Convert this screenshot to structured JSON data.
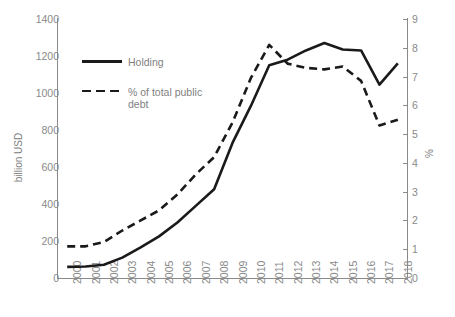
{
  "chart_data": {
    "type": "line",
    "title": "",
    "xlabel": "",
    "ylabel": "billion USD",
    "y2label": "%",
    "grid": false,
    "legend_position": "inside-upper-left",
    "categories": [
      "2000",
      "2001",
      "2002",
      "2003",
      "2004",
      "2005",
      "2006",
      "2007",
      "2008",
      "2009",
      "2010",
      "2011",
      "2012",
      "2013",
      "2014",
      "2015",
      "2016",
      "2017",
      "2018"
    ],
    "ylim": [
      0,
      1400
    ],
    "yticks": [
      0,
      200,
      400,
      600,
      800,
      1000,
      1200,
      1400
    ],
    "y2lim": [
      0,
      9
    ],
    "y2ticks": [
      0,
      1,
      2,
      3,
      4,
      5,
      6,
      7,
      8,
      9
    ],
    "series": [
      {
        "name": "Holding",
        "axis": "left",
        "units": "billion USD",
        "style": "solid",
        "color": "#1a1a1a",
        "values": [
          60,
          62,
          72,
          110,
          165,
          225,
          300,
          390,
          480,
          730,
          930,
          1150,
          1180,
          1230,
          1270,
          1235,
          1230,
          1045,
          1160
        ]
      },
      {
        "name": "% of total public debt",
        "axis": "right",
        "units": "%",
        "style": "dashed",
        "color": "#1a1a1a",
        "values": [
          1.1,
          1.1,
          1.25,
          1.65,
          2.0,
          2.35,
          2.9,
          3.6,
          4.2,
          5.4,
          6.95,
          8.1,
          7.45,
          7.3,
          7.25,
          7.35,
          6.85,
          5.3,
          5.5
        ]
      }
    ]
  },
  "legend": {
    "entries": [
      {
        "label": "Holding"
      },
      {
        "label": "% of total public debt"
      }
    ]
  },
  "colors": {
    "line": "#1a1a1a",
    "axis": "#8a8a8a",
    "tick_text": "#898989",
    "axis_title": "#808080",
    "background": "#ffffff"
  },
  "title_strip": {
    "text": ""
  }
}
